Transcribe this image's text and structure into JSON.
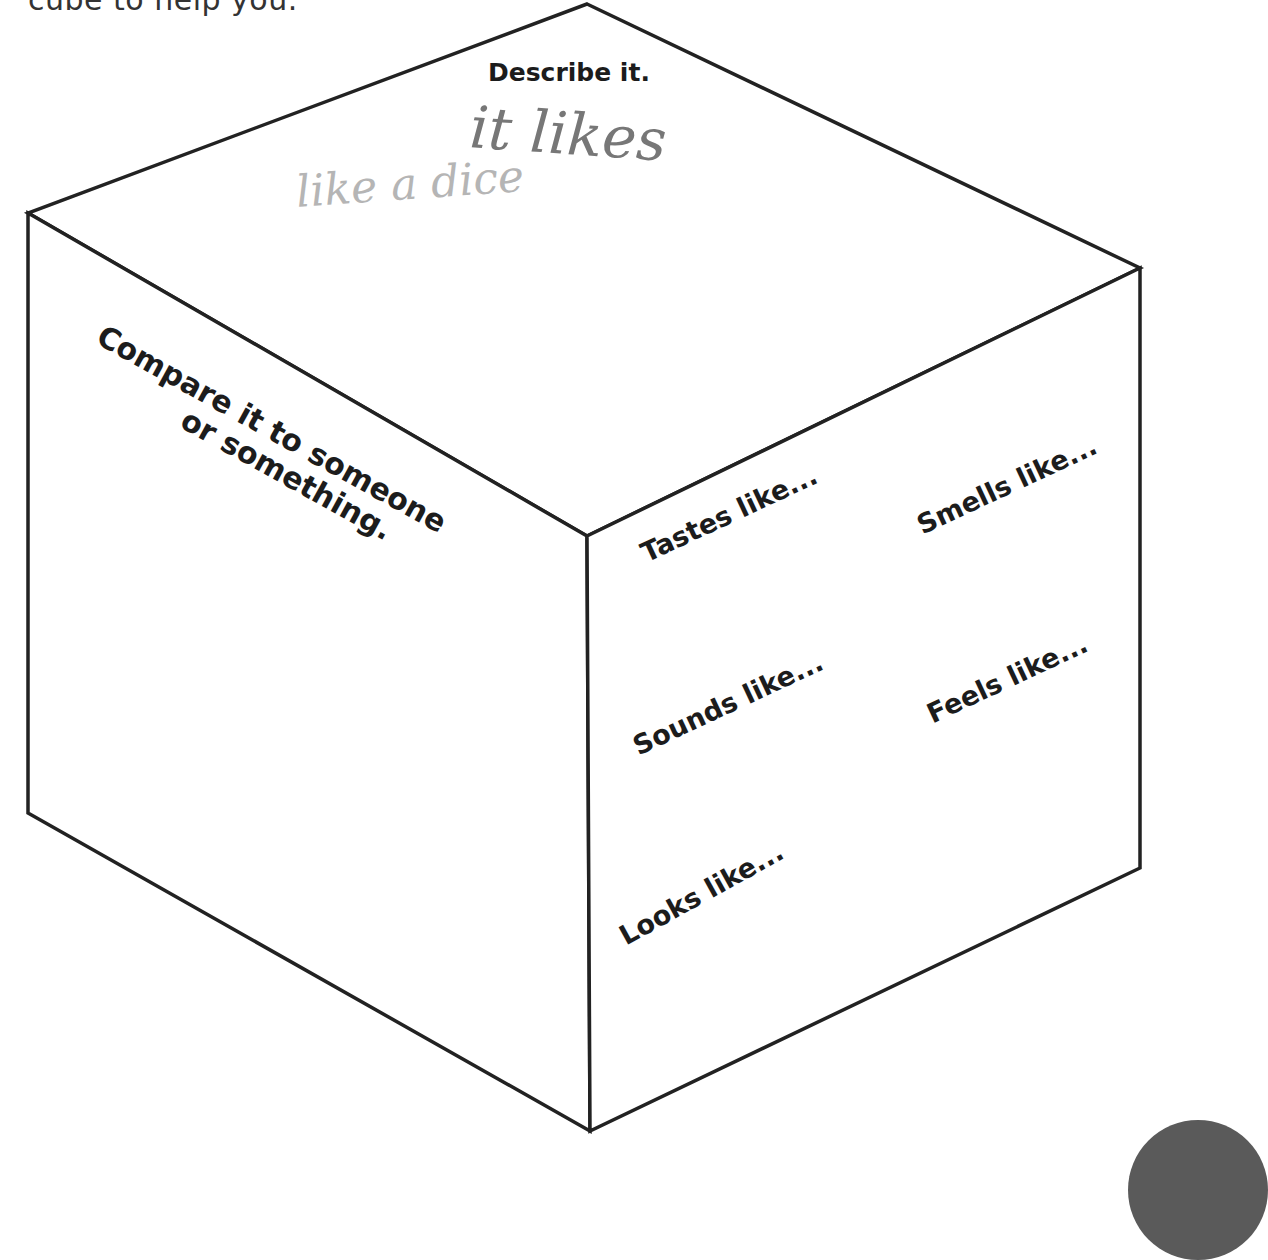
{
  "intro_text": "cube to help you.",
  "cube": {
    "stroke_color": "#222222",
    "vertices": {
      "top": [
        587,
        4
      ],
      "left_top": [
        28,
        213
      ],
      "right_top": [
        1140,
        268
      ],
      "center": [
        587,
        536
      ],
      "left_bottom": [
        28,
        813
      ],
      "right_bottom": [
        1140,
        868
      ],
      "bottom": [
        590,
        1131
      ]
    }
  },
  "top_face": {
    "prompt": "Describe it.",
    "handwriting": {
      "line1": "it likes",
      "line2": "like a dice"
    }
  },
  "left_face": {
    "prompt_line1": "Compare it to someone",
    "prompt_line2": "or something."
  },
  "right_face": {
    "prompts": [
      {
        "id": "tastes",
        "label": "Tastes like..."
      },
      {
        "id": "smells",
        "label": "Smells like..."
      },
      {
        "id": "sounds",
        "label": "Sounds like..."
      },
      {
        "id": "feels",
        "label": "Feels like..."
      },
      {
        "id": "looks",
        "label": "Looks like..."
      }
    ]
  }
}
